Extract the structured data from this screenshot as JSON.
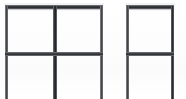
{
  "scene": {
    "title": "Two dark metal frame panels",
    "description": "Photograph of two powder-coated metal frame panels on a white background; each panel is an open rectangle with a horizontal mid rail. The left panel is a wide double bay with a central vertical post; the right panel is a narrow single bay. The vertical posts run off the bottom edge of the frame.",
    "width_px": 186,
    "height_px": 99,
    "background_color": "#ffffff",
    "frame_color": "#2a2c30",
    "highlight_color": "#8e9095",
    "object_count": 2
  },
  "panels": [
    {
      "name": "left-panel",
      "label": "Wide double-bay frame",
      "bays": 2,
      "x": 5,
      "y": 5,
      "width": 98,
      "height": 94,
      "top_rail_y": 5,
      "mid_rail_y": 52,
      "center_post_x": 53,
      "bottom_open": true
    },
    {
      "name": "right-panel",
      "label": "Narrow single-bay frame",
      "bays": 1,
      "x": 126,
      "y": 5,
      "width": 48,
      "height": 94,
      "top_rail_y": 5,
      "mid_rail_y": 52,
      "bottom_open": true
    }
  ],
  "members": {
    "top_rail_label": "top rail",
    "mid_rail_label": "mid rail",
    "post_label": "vertical post",
    "center_post_label": "center post"
  }
}
